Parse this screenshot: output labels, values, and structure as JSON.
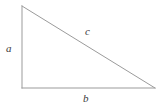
{
  "figure": {
    "type": "right-triangle-diagram",
    "background_color": "#ffffff",
    "width": 162,
    "height": 109,
    "stroke_color": "#9b9b9b",
    "stroke_width": 1,
    "label_color": "#3b3b3b",
    "vertices": {
      "top": [
        22,
        6
      ],
      "bottom_left": [
        22,
        88
      ],
      "bottom_right": [
        155,
        88
      ]
    },
    "labels": {
      "leg_vertical": "a",
      "hypotenuse": "c",
      "leg_horizontal": "b"
    }
  }
}
